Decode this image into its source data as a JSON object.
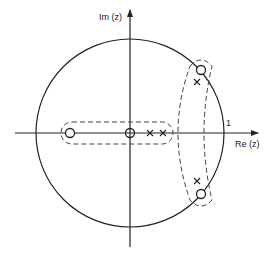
{
  "diagram": {
    "type": "pole-zero plot (z-plane)",
    "axes": {
      "imag_label": "Im (z)",
      "real_label": "Re (z)",
      "unit_label": "1"
    },
    "unit_circle": {
      "radius": 1
    },
    "zeros": [
      {
        "name": "zero-left",
        "approx": [
          -0.64,
          0
        ]
      },
      {
        "name": "zero-origin",
        "approx": [
          0,
          0
        ]
      },
      {
        "name": "zero-upper",
        "approx": [
          0.76,
          0.67
        ]
      },
      {
        "name": "zero-lower",
        "approx": [
          0.76,
          -0.65
        ]
      }
    ],
    "poles": [
      {
        "name": "pole-real-1",
        "approx": [
          0.21,
          0
        ]
      },
      {
        "name": "pole-real-2",
        "approx": [
          0.35,
          0
        ]
      },
      {
        "name": "pole-upper",
        "approx": [
          0.71,
          0.54
        ]
      },
      {
        "name": "pole-lower",
        "approx": [
          0.71,
          -0.51
        ]
      }
    ],
    "groupings": [
      {
        "name": "real-axis-group",
        "style": "dashed rounded rectangle"
      },
      {
        "name": "complex-pair-group",
        "style": "dashed crescent"
      }
    ],
    "colors": {
      "stroke": "#222222",
      "background": "#ffffff"
    }
  }
}
